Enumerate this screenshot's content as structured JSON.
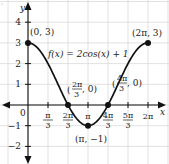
{
  "chart_data": {
    "type": "line",
    "title": "",
    "function_label": "f(x) = 2cos(x) + 1",
    "xlabel": "x",
    "ylabel": "y",
    "xlim": [
      -1.0472,
      7.0
    ],
    "ylim": [
      -2.8,
      4.8
    ],
    "grid": true,
    "x_ticks": [
      {
        "value": 1.0472,
        "num": "π",
        "den": "3"
      },
      {
        "value": 2.0944,
        "num": "2π",
        "den": "3"
      },
      {
        "value": 3.1416,
        "label": "π"
      },
      {
        "value": 4.1888,
        "num": "4π",
        "den": "3"
      },
      {
        "value": 5.236,
        "num": "5π",
        "den": "3"
      },
      {
        "value": 6.2832,
        "label": "2π"
      }
    ],
    "y_ticks": [
      {
        "value": 4,
        "label": "4"
      },
      {
        "value": 3,
        "label": "3"
      },
      {
        "value": 2,
        "label": "2"
      },
      {
        "value": 1,
        "label": "1"
      },
      {
        "value": -1,
        "label": "−1"
      },
      {
        "value": -2,
        "label": "−2"
      }
    ],
    "origin_label": "0",
    "series": [
      {
        "name": "f(x) = 2cos(x) + 1",
        "domain": [
          0,
          6.2832
        ],
        "x": [
          0,
          0.5236,
          1.0472,
          1.5708,
          2.0944,
          2.618,
          3.1416,
          3.6652,
          4.1888,
          4.7124,
          5.236,
          5.7596,
          6.2832
        ],
        "y": [
          3,
          2.732,
          2,
          1,
          0,
          -0.732,
          -1,
          -0.732,
          0,
          1,
          2,
          2.732,
          3
        ]
      }
    ],
    "key_points": [
      {
        "x": 0,
        "y": 3,
        "label": "(0, 3)"
      },
      {
        "x": 2.0944,
        "y": 0,
        "label_num": "2π",
        "label_den": "3",
        "label_rest": ", 0"
      },
      {
        "x": 3.1416,
        "y": -1,
        "label": "(π, −1)"
      },
      {
        "x": 4.1888,
        "y": 0,
        "label_num": "4π",
        "label_den": "3",
        "label_rest": ", 0"
      },
      {
        "x": 6.2832,
        "y": 3,
        "label": "(2π, 3)"
      }
    ]
  },
  "labels": {
    "function": "f(x) = 2cos(x) + 1",
    "p0": "(0, 3)",
    "p2pi": "(2π, 3)",
    "pmin": "(π, −1)",
    "zero1_num": "2π",
    "zero1_den": "3",
    "zero1_rest": ", 0)",
    "zero2_num": "4π",
    "zero2_den": "3",
    "zero2_rest": ", 0)",
    "x_axis": "x",
    "y_axis": "y",
    "origin": "0"
  }
}
